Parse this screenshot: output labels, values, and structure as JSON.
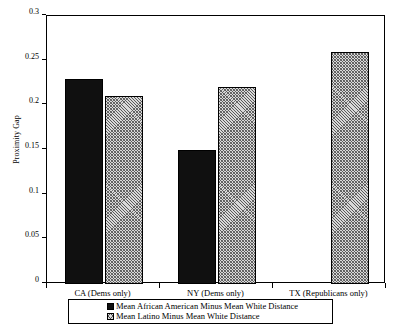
{
  "chart_data": {
    "type": "bar",
    "title": "",
    "xlabel": "",
    "ylabel": "Proximity Gap",
    "ylim": [
      0,
      0.3
    ],
    "yticks": [
      "0",
      "0.05",
      "0.1",
      "0.15",
      "0.2",
      "0.25",
      "0.3"
    ],
    "ytick_values": [
      0,
      0.05,
      0.1,
      0.15,
      0.2,
      0.25,
      0.3
    ],
    "grid": false,
    "legend_position": "bottom",
    "categories": [
      "CA (Dems only)",
      "NY (Dems only)",
      "TX (Republicans only)"
    ],
    "series": [
      {
        "name": "Mean African American Minus Mean White Distance",
        "pattern": "solid-black",
        "values": [
          0.23,
          0.15,
          null
        ]
      },
      {
        "name": "Mean Latino Minus Mean White Distance",
        "pattern": "hatched-gray",
        "values": [
          0.21,
          0.22,
          0.26
        ]
      }
    ]
  }
}
